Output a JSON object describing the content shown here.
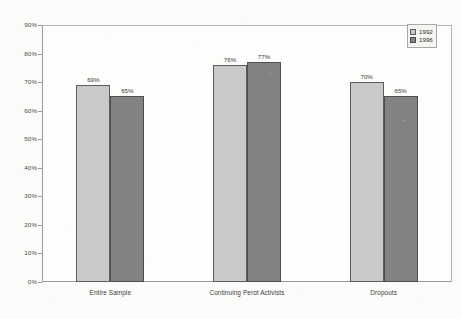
{
  "chart_data": {
    "type": "bar",
    "title": "",
    "subtitle": "",
    "xlabel": "",
    "ylabel": "",
    "categories": [
      "Entire Sample",
      "Continuing Perot Activists",
      "Dropouts"
    ],
    "series": [
      {
        "name": "1992",
        "values": [
          69,
          76,
          70
        ],
        "color": "#c9c9c9"
      },
      {
        "name": "1996",
        "values": [
          65,
          77,
          65
        ],
        "color": "#828282"
      }
    ],
    "data_labels": [
      [
        "69%",
        "65%"
      ],
      [
        "76%",
        "77%"
      ],
      [
        "70%",
        "65%"
      ]
    ],
    "ylim": [
      0,
      90
    ],
    "ytick_step": 10,
    "ytick_labels": [
      "0%",
      "10%",
      "20%",
      "30%",
      "40%",
      "50%",
      "60%",
      "70%",
      "80%",
      "90%"
    ],
    "ytick_values": [
      0,
      10,
      20,
      30,
      40,
      50,
      60,
      70,
      80,
      90
    ],
    "grid": false,
    "legend_position": "top-right",
    "legend_entries": [
      "1992",
      "1996"
    ],
    "value_suffix": "%"
  },
  "colors": {
    "series_1992": "#c9c9c9",
    "series_1996": "#828282",
    "bar_outline": "#5d5d5d",
    "axis": "#9a9a9a",
    "plot_background": "#fdfdfc",
    "page_background": "#fbfbfa",
    "label_text": "#3a3a3a"
  }
}
